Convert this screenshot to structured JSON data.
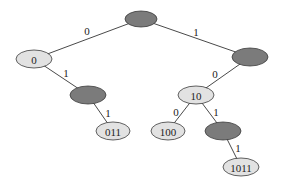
{
  "diagram": {
    "type": "binary-trie",
    "colors": {
      "internal_fill": "#7b7b7b",
      "leaf_fill": "#e2e2e2",
      "stroke": "#3a3a3a",
      "edge": "#4a4a4a"
    },
    "nodes": [
      {
        "id": "root",
        "label": "",
        "kind": "internal",
        "cx": 141,
        "cy": 19,
        "rx": 16,
        "ry": 8
      },
      {
        "id": "n0",
        "label": "0",
        "kind": "leaf",
        "cx": 34,
        "cy": 59,
        "rx": 18,
        "ry": 9
      },
      {
        "id": "n1",
        "label": "",
        "kind": "internal",
        "cx": 250,
        "cy": 57,
        "rx": 18,
        "ry": 9
      },
      {
        "id": "n01",
        "label": "",
        "kind": "internal",
        "cx": 88,
        "cy": 95,
        "rx": 18,
        "ry": 9
      },
      {
        "id": "n10",
        "label": "10",
        "kind": "leaf",
        "cx": 196,
        "cy": 95,
        "rx": 18,
        "ry": 9
      },
      {
        "id": "n011",
        "label": "011",
        "kind": "leaf",
        "cx": 113,
        "cy": 131,
        "rx": 17,
        "ry": 9
      },
      {
        "id": "n100",
        "label": "100",
        "kind": "leaf",
        "cx": 168,
        "cy": 131,
        "rx": 17,
        "ry": 9
      },
      {
        "id": "n101",
        "label": "",
        "kind": "internal",
        "cx": 223,
        "cy": 131,
        "rx": 18,
        "ry": 9
      },
      {
        "id": "n1011",
        "label": "1011",
        "kind": "leaf",
        "cx": 241,
        "cy": 167,
        "rx": 18,
        "ry": 9
      }
    ],
    "edges": [
      {
        "from": "root",
        "to": "n0",
        "label": "0",
        "lx": 87,
        "ly": 31
      },
      {
        "from": "root",
        "to": "n1",
        "label": "1",
        "lx": 196,
        "ly": 32
      },
      {
        "from": "n0",
        "to": "n01",
        "label": "1",
        "lx": 66,
        "ly": 73
      },
      {
        "from": "n1",
        "to": "n10",
        "label": "0",
        "lx": 215,
        "ly": 74
      },
      {
        "from": "n01",
        "to": "n011",
        "label": "1",
        "lx": 108,
        "ly": 113
      },
      {
        "from": "n10",
        "to": "n100",
        "label": "0",
        "lx": 176,
        "ly": 112
      },
      {
        "from": "n10",
        "to": "n101",
        "label": "1",
        "lx": 216,
        "ly": 112
      },
      {
        "from": "n101",
        "to": "n1011",
        "label": "1",
        "lx": 238,
        "ly": 148
      }
    ]
  }
}
